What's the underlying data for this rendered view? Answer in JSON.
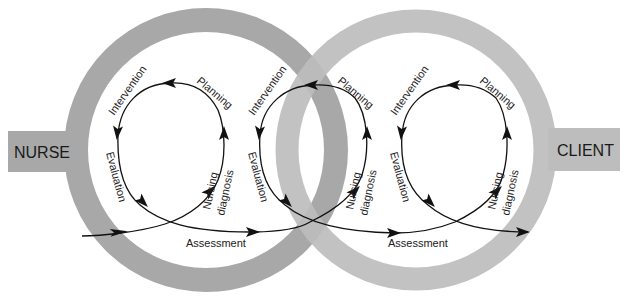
{
  "diagram": {
    "left_entity": "NURSE",
    "right_entity": "CLIENT",
    "colors": {
      "background": "#ffffff",
      "left_ring": "#a8a8a8",
      "right_ring": "#bdbdbd",
      "entity_box_left": "#a8a8a8",
      "entity_box_right": "#bdbdbd",
      "arrows": "#111111",
      "text": "#222222"
    },
    "loops": [
      {
        "id": "nurse-loop",
        "steps": [
          "Assessment",
          "Nursing diagnosis",
          "Planning",
          "Intervention",
          "Evaluation"
        ],
        "labels": {
          "intervention": "Intervention",
          "planning": "Planning",
          "evaluation": "Evaluation",
          "nursing": "Nursing",
          "diagnosis": "diagnosis",
          "assessment": "Assessment"
        }
      },
      {
        "id": "shared-loop",
        "steps": [
          "Assessment",
          "Nursing diagnosis",
          "Planning",
          "Intervention",
          "Evaluation"
        ],
        "labels": {
          "intervention": "Intervention",
          "planning": "Planning",
          "evaluation": "Evaluation",
          "nursing": "Nursing",
          "diagnosis": "diagnosis",
          "assessment": "Assessment"
        }
      },
      {
        "id": "client-loop",
        "steps": [
          "Assessment",
          "Nursing diagnosis",
          "Planning",
          "Intervention",
          "Evaluation"
        ],
        "labels": {
          "intervention": "Intervention",
          "planning": "Planning",
          "evaluation": "Evaluation",
          "nursing": "Nursing",
          "diagnosis": "diagnosis"
        }
      }
    ]
  }
}
